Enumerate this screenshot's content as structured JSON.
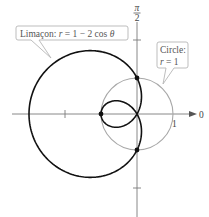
{
  "chart_data": {
    "type": "polar",
    "title": "",
    "curves": [
      {
        "name": "Limaçon",
        "equation": "r = 1 − 2 cos θ",
        "color": "#111111",
        "stroke_width": 1.6,
        "theta_range": [
          0,
          6.2832
        ]
      },
      {
        "name": "Circle",
        "equation": "r = 1",
        "radius": 1,
        "color": "#a8a8a8",
        "stroke_width": 1.1
      }
    ],
    "intersection_points": [
      {
        "label": "top",
        "r": 1,
        "theta": "π/2",
        "x": 0,
        "y": 1
      },
      {
        "label": "bottom",
        "r": 1,
        "theta": "3π/2",
        "x": 0,
        "y": -1
      },
      {
        "label": "inner-loop-tip",
        "r": -1,
        "theta": "0",
        "x": -1,
        "y": 0
      }
    ],
    "axes": {
      "polar_axis_label": "0",
      "vertical_axis_label": "π/2",
      "tick_label_1": "1",
      "ticks_x": [
        -2,
        1
      ],
      "ticks_y": [
        2,
        -2
      ]
    },
    "scale_px_per_unit": 36,
    "origin_px": [
      137,
      114
    ]
  },
  "labels": {
    "limacon": {
      "text_prefix": "Limaçon: ",
      "r_var": "r",
      "equals": " = 1 − 2 cos ",
      "theta": "θ"
    },
    "circle": {
      "line1": "Circle:",
      "r_var": "r",
      "line2_rest": " = 1"
    },
    "axis_zero": "0",
    "axis_one": "1",
    "pi": "π",
    "two": "2"
  }
}
